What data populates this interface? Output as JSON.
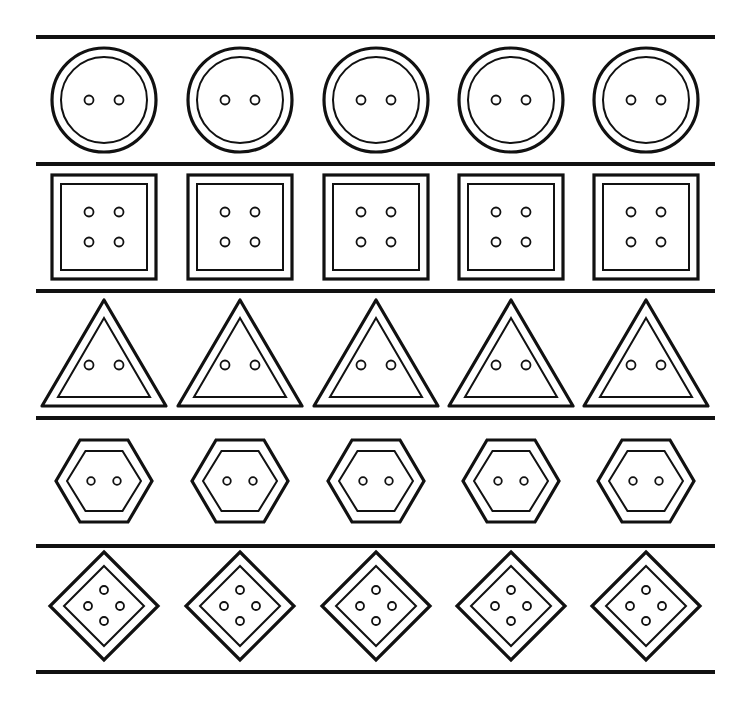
{
  "page": {
    "width": 749,
    "height": 705,
    "background": "#ffffff",
    "ink": "#111111"
  },
  "divider_lines": [
    {
      "y": 37,
      "x1": 36,
      "x2": 715
    },
    {
      "y": 164,
      "x1": 36,
      "x2": 715
    },
    {
      "y": 291,
      "x1": 36,
      "x2": 715
    },
    {
      "y": 418,
      "x1": 36,
      "x2": 715
    },
    {
      "y": 546,
      "x1": 36,
      "x2": 715
    },
    {
      "y": 672,
      "x1": 36,
      "x2": 715
    }
  ],
  "column_centers": [
    104,
    240,
    376,
    511,
    646
  ],
  "rows": [
    {
      "name": "circle-buttons",
      "shape": "circle",
      "cy": 100,
      "outer": 52,
      "inner": 43,
      "holes": [
        [
          -15,
          0
        ],
        [
          15,
          0
        ]
      ],
      "hole_r": 4.5
    },
    {
      "name": "square-buttons",
      "shape": "square",
      "cy": 227,
      "outer": 52,
      "inner": 43,
      "holes": [
        [
          -15,
          -15
        ],
        [
          15,
          -15
        ],
        [
          -15,
          15
        ],
        [
          15,
          15
        ]
      ],
      "hole_r": 4.5
    },
    {
      "name": "triangle-buttons",
      "shape": "triangle",
      "cy": 355,
      "outer_top": 300,
      "outer_bottom": 406,
      "outer_half": 62,
      "inner_top": 318,
      "inner_bottom": 397,
      "inner_half": 46,
      "holes": [
        [
          -15,
          10
        ],
        [
          15,
          10
        ]
      ],
      "hole_r": 4.5
    },
    {
      "name": "hexagon-buttons",
      "shape": "hexagon",
      "cy": 481,
      "outer_w": 48,
      "outer_h": 41,
      "inner_w": 37,
      "inner_h": 30,
      "holes": [
        [
          -13,
          0
        ],
        [
          13,
          0
        ]
      ],
      "hole_r": 3.8
    },
    {
      "name": "diamond-buttons",
      "shape": "diamond",
      "cy": 606,
      "outer": 54,
      "inner": 40,
      "holes": [
        [
          0,
          -16
        ],
        [
          -16,
          0
        ],
        [
          16,
          0
        ],
        [
          0,
          15
        ]
      ],
      "hole_r": 4
    }
  ]
}
